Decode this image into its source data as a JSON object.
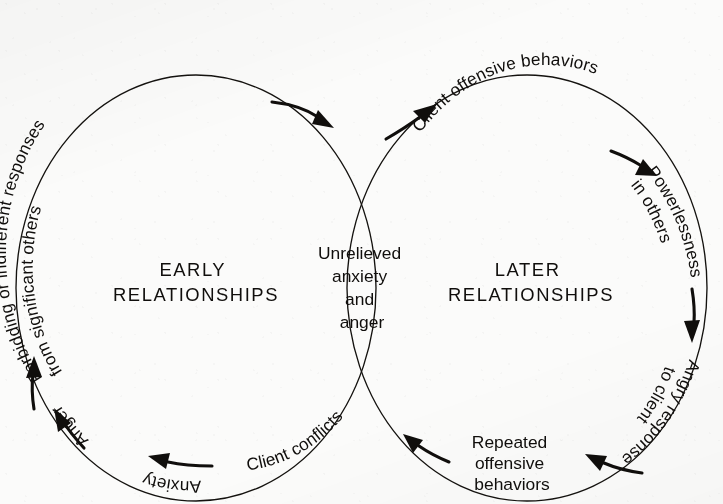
{
  "figure": {
    "type": "two-interlocking-cycles-venn",
    "background_color": "#fbfbfa",
    "ink_color": "#100e0c"
  },
  "left_cycle": {
    "title_line1": "EARLY",
    "title_line2": "RELATIONSHIPS",
    "steps": [
      {
        "id": "forbidding",
        "line1": "Forbidding or indifferent responses",
        "line2": "from significant others",
        "position": "upper-left-arc"
      },
      {
        "id": "anger",
        "label": "Anger",
        "position": "left-lower-arc"
      },
      {
        "id": "anxiety",
        "label": "Anxiety",
        "position": "lower-left-arc"
      },
      {
        "id": "client-conflicts",
        "label": "Client conflicts",
        "position": "bottom-arc"
      }
    ]
  },
  "right_cycle": {
    "title_line1": "LATER",
    "title_line2": "RELATIONSHIPS",
    "steps": [
      {
        "id": "client-offensive",
        "label": "Client offensive behaviors",
        "position": "top-arc"
      },
      {
        "id": "powerlessness",
        "line1": "Powerlessness",
        "line2": "in others",
        "position": "upper-right-arc"
      },
      {
        "id": "angry-response",
        "line1": "Angry response",
        "line2": "to client",
        "position": "lower-right-arc"
      },
      {
        "id": "repeated-offensive",
        "line1": "Repeated",
        "line2": "offensive",
        "line3": "behaviors",
        "position": "bottom-arc"
      }
    ]
  },
  "overlap": {
    "line1": "Unrelieved",
    "line2": "anxiety",
    "line3": "and",
    "line4": "anger"
  }
}
